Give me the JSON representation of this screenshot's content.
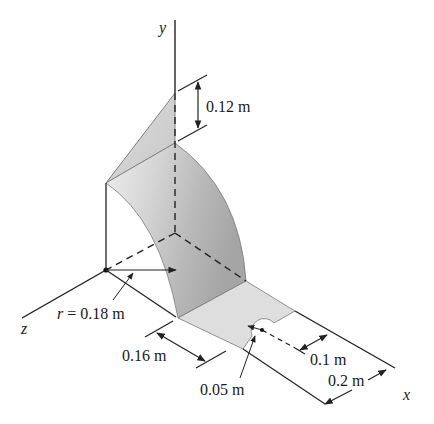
{
  "figure": {
    "type": "3D engineering diagram",
    "axes": {
      "x": "x",
      "y": "y",
      "z": "z"
    },
    "dimensions": {
      "height_top": "0.12 m",
      "radius": "r = 0.18 m",
      "plate_width": "0.16 m",
      "hole_radius": "0.05 m",
      "hole_offset": "0.1 m",
      "plate_length": "0.2 m"
    },
    "colors": {
      "surface_light": "#e4e4e4",
      "surface_mid": "#cfcfcf",
      "surface_dark": "#a9a9a9",
      "line": "#222222"
    }
  }
}
